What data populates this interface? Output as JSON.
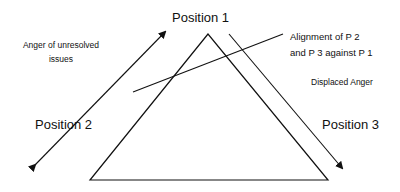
{
  "diagram": {
    "labels": {
      "position1": "Position 1",
      "position2": "Position 2",
      "position3": "Position 3",
      "anger_line1": "Anger of unresolved",
      "anger_line2": "issues",
      "alignment_line1": "Alignment of P 2",
      "alignment_line2": "and P 3 against P 1",
      "displaced": "Displaced Anger"
    },
    "colors": {
      "stroke": "#111111",
      "background": "#ffffff"
    }
  }
}
